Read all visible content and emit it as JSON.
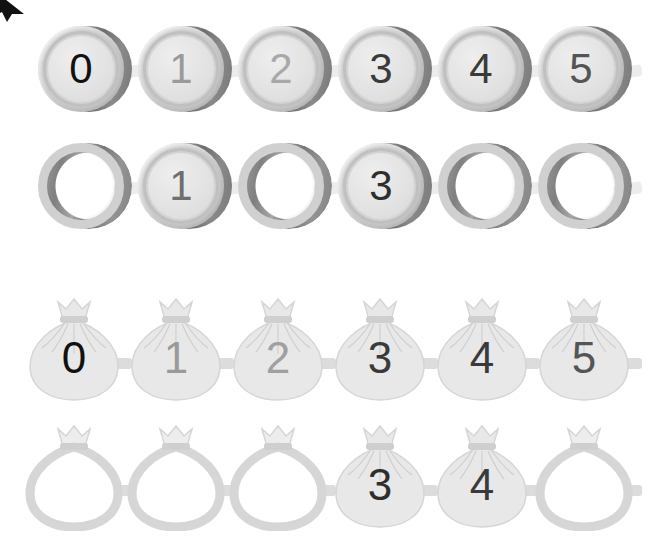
{
  "canvas": {
    "width": 662,
    "height": 550,
    "background": "#ffffff"
  },
  "cursor": {
    "name": "mouse-cursor-arrow",
    "color": "#111111",
    "position": "top-left-corner-clipped"
  },
  "palette": {
    "coin_rim": "#c9c9c9",
    "coin_ring": "#d3d3d3",
    "coin_face": "#e4e4e4",
    "coin_edge_dark": "#757575",
    "bag_body": "#e6e6e6",
    "bag_outline": "#d7d7d7",
    "connector": "#ececec",
    "digit_black": "#111111",
    "digit_dark": "#3a3a3a",
    "digit_mid": "#6f6f6f",
    "digit_light": "#a8a8a8",
    "digit_pale": "#9a9a9a"
  },
  "rows": [
    {
      "id": "coins-filled-row",
      "label": "Coin number line (all visible)",
      "type": "coin",
      "top": 24,
      "left": 36,
      "step": 100,
      "items": [
        {
          "index": 0,
          "digit": "0",
          "filled": true,
          "digit_color": "#111111"
        },
        {
          "index": 1,
          "digit": "1",
          "filled": true,
          "digit_color": "#9a9a9a"
        },
        {
          "index": 2,
          "digit": "2",
          "filled": true,
          "digit_color": "#a8a8a8"
        },
        {
          "index": 3,
          "digit": "3",
          "filled": true,
          "digit_color": "#3a3a3a"
        },
        {
          "index": 4,
          "digit": "4",
          "filled": true,
          "digit_color": "#3a3a3a"
        },
        {
          "index": 5,
          "digit": "5",
          "filled": true,
          "digit_color": "#555555"
        }
      ]
    },
    {
      "id": "coins-partial-row",
      "label": "Coin number line (missing numbers)",
      "type": "coin",
      "top": 141,
      "left": 36,
      "step": 100,
      "items": [
        {
          "index": 0,
          "digit": "",
          "filled": false,
          "digit_color": ""
        },
        {
          "index": 1,
          "digit": "1",
          "filled": true,
          "digit_color": "#6f6f6f"
        },
        {
          "index": 2,
          "digit": "",
          "filled": false,
          "digit_color": ""
        },
        {
          "index": 3,
          "digit": "3",
          "filled": true,
          "digit_color": "#2e2e2e"
        },
        {
          "index": 4,
          "digit": "",
          "filled": false,
          "digit_color": ""
        },
        {
          "index": 5,
          "digit": "",
          "filled": false,
          "digit_color": ""
        }
      ]
    },
    {
      "id": "bags-filled-row",
      "label": "Money bag number line (all visible)",
      "type": "bag",
      "top": 296,
      "left": 22,
      "step": 102,
      "items": [
        {
          "index": 0,
          "digit": "0",
          "filled": true,
          "digit_color": "#111111"
        },
        {
          "index": 1,
          "digit": "1",
          "filled": true,
          "digit_color": "#9a9a9a"
        },
        {
          "index": 2,
          "digit": "2",
          "filled": true,
          "digit_color": "#a0a0a0"
        },
        {
          "index": 3,
          "digit": "3",
          "filled": true,
          "digit_color": "#3a3a3a"
        },
        {
          "index": 4,
          "digit": "4",
          "filled": true,
          "digit_color": "#3a3a3a"
        },
        {
          "index": 5,
          "digit": "5",
          "filled": true,
          "digit_color": "#555555"
        }
      ]
    },
    {
      "id": "bags-partial-row",
      "label": "Money bag number line (missing numbers)",
      "type": "bag",
      "top": 423,
      "left": 22,
      "step": 102,
      "items": [
        {
          "index": 0,
          "digit": "",
          "filled": false,
          "digit_color": ""
        },
        {
          "index": 1,
          "digit": "",
          "filled": false,
          "digit_color": ""
        },
        {
          "index": 2,
          "digit": "",
          "filled": false,
          "digit_color": ""
        },
        {
          "index": 3,
          "digit": "3",
          "filled": true,
          "digit_color": "#2e2e2e"
        },
        {
          "index": 4,
          "digit": "4",
          "filled": true,
          "digit_color": "#3a3a3a"
        },
        {
          "index": 5,
          "digit": "",
          "filled": false,
          "digit_color": ""
        }
      ]
    }
  ]
}
